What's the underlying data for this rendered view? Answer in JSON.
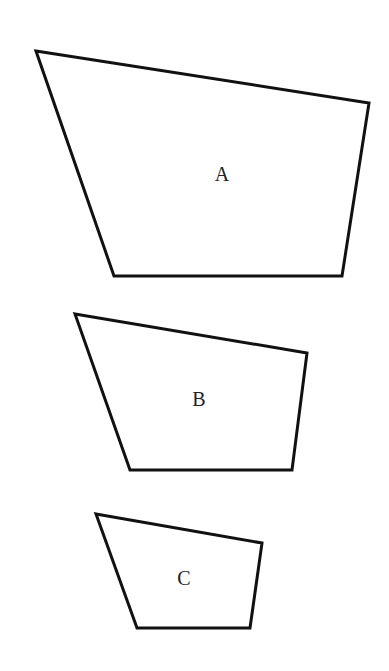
{
  "figure": {
    "width": 389,
    "height": 671,
    "background": "#ffffff",
    "stroke_color": "#111111"
  },
  "shapes": [
    {
      "id": "A",
      "label": "A",
      "points": [
        [
          36,
          51
        ],
        [
          369,
          103
        ],
        [
          342,
          276
        ],
        [
          114,
          276
        ]
      ],
      "label_pos": [
        222,
        176
      ]
    },
    {
      "id": "B",
      "label": "B",
      "points": [
        [
          75,
          314
        ],
        [
          307,
          353
        ],
        [
          292,
          470
        ],
        [
          130,
          470
        ]
      ],
      "label_pos": [
        199,
        401
      ]
    },
    {
      "id": "C",
      "label": "C",
      "points": [
        [
          96,
          514
        ],
        [
          262,
          543
        ],
        [
          250,
          628
        ],
        [
          137,
          628
        ]
      ],
      "label_pos": [
        184,
        580
      ]
    }
  ]
}
